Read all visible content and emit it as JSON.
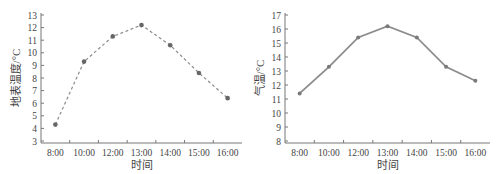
{
  "chart_data": [
    {
      "type": "line",
      "title": "",
      "xlabel": "时间",
      "ylabel": "地表温度/°C",
      "categories": [
        "8:00",
        "10:00",
        "12:00",
        "13:00",
        "14:00",
        "15:00",
        "16:00"
      ],
      "series": [
        {
          "name": "地表温度",
          "values": [
            4.3,
            9.3,
            11.3,
            12.2,
            10.6,
            8.4,
            6.4
          ],
          "line_style": "dashed",
          "color": "#8c8c8c",
          "marker_color": "#666666"
        }
      ],
      "yticks": [
        3,
        4,
        5,
        6,
        7,
        8,
        9,
        10,
        11,
        12,
        13
      ],
      "ylim": [
        3,
        13
      ],
      "grid": false,
      "legend": "none"
    },
    {
      "type": "line",
      "title": "",
      "xlabel": "时间",
      "ylabel": "气温/°C",
      "categories": [
        "8:00",
        "10:00",
        "12:00",
        "13:00",
        "14:00",
        "15:00",
        "16:00"
      ],
      "series": [
        {
          "name": "气温",
          "values": [
            11.4,
            13.3,
            15.4,
            16.2,
            15.4,
            13.3,
            12.3
          ],
          "line_style": "solid",
          "color": "#8c8c8c",
          "marker_color": "#7a7a7a"
        }
      ],
      "yticks": [
        8,
        9,
        10,
        11,
        12,
        13,
        14,
        15,
        16,
        17
      ],
      "ylim": [
        8,
        17
      ],
      "grid": false,
      "legend": "none"
    }
  ]
}
